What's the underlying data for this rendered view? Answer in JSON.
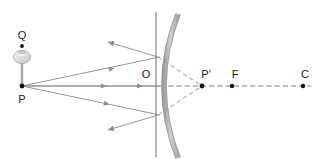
{
  "figure": {
    "kind": "optics-ray-diagram",
    "background_color": "#ffffff"
  },
  "colors": {
    "ray_line": "#8a8a8a",
    "virtual_dashed": "#9a9a9a",
    "mirror_glass": "#bdbdbd",
    "mirror_edge": "#8c8c8c",
    "axis_line": "#555555",
    "label_text": "#1b1b1b",
    "point_dot": "#111111",
    "bulb_body": "#d8d8d8",
    "bulb_outline": "#a6a6a6"
  },
  "labels": [
    {
      "id": "Q",
      "text": "Q",
      "x": 22,
      "y": 39,
      "anchor": "middle"
    },
    {
      "id": "P",
      "text": "P",
      "x": 22,
      "y": 103,
      "anchor": "middle"
    },
    {
      "id": "O",
      "text": "O",
      "x": 146,
      "y": 78,
      "anchor": "middle"
    },
    {
      "id": "Pp",
      "text": "P′",
      "x": 206,
      "y": 78,
      "anchor": "middle"
    },
    {
      "id": "F",
      "text": "F",
      "x": 235,
      "y": 78,
      "anchor": "middle"
    },
    {
      "id": "C",
      "text": "C",
      "x": 305,
      "y": 78,
      "anchor": "middle"
    }
  ],
  "points": [
    {
      "id": "Q-dot",
      "x": 22,
      "y": 46,
      "r": 1.9
    },
    {
      "id": "P-dot",
      "x": 22,
      "y": 86,
      "r": 2.4
    },
    {
      "id": "Pp-dot",
      "x": 202,
      "y": 86,
      "r": 2.4
    },
    {
      "id": "F-dot",
      "x": 232,
      "y": 86,
      "r": 2.2
    },
    {
      "id": "C-dot",
      "x": 303,
      "y": 86,
      "r": 2.2
    }
  ],
  "principal_axis": {
    "y": 86,
    "x_start": 22,
    "x_end": 160
  },
  "optical_axis_virtual": {
    "y": 86,
    "x_start": 160,
    "x_end": 310
  },
  "mirror": {
    "type": "concave",
    "pole_x": 160,
    "pole_y": 86,
    "top_x": 178,
    "top_y": 14,
    "bottom_x": 178,
    "bottom_y": 158,
    "thickness": 4.5,
    "optical_axis_line_x": 156,
    "optical_axis_line_y1": 12,
    "optical_axis_line_y2": 157
  },
  "incident_rays": [
    {
      "id": "upper-incident",
      "x1": 22,
      "y1": 86,
      "x2": 158,
      "y2": 57,
      "arrow_t": 0.63
    },
    {
      "id": "axis-incident",
      "x1": 22,
      "y1": 86,
      "x2": 158,
      "y2": 86,
      "arrow_t": 0.6
    },
    {
      "id": "lower-incident",
      "x1": 22,
      "y1": 86,
      "x2": 158,
      "y2": 115,
      "arrow_t": 0.63
    }
  ],
  "reflected_rays": [
    {
      "id": "upper-reflected",
      "x1": 158,
      "y1": 57,
      "x2": 103,
      "y2": 40
    },
    {
      "id": "lower-reflected",
      "x1": 158,
      "y1": 115,
      "x2": 103,
      "y2": 131
    }
  ],
  "virtual_rays": [
    {
      "id": "virtual-upper",
      "x1": 158,
      "y1": 57,
      "x2": 202,
      "y2": 86
    },
    {
      "id": "virtual-lower",
      "x1": 158,
      "y1": 115,
      "x2": 202,
      "y2": 86
    }
  ],
  "object": {
    "name": "light-bulb-object",
    "stem_x": 22,
    "stem_top": 52,
    "stem_bottom": 86,
    "bulb_cx": 22,
    "bulb_cy": 57,
    "bulb_rx": 8.5,
    "bulb_ry": 6.5
  }
}
